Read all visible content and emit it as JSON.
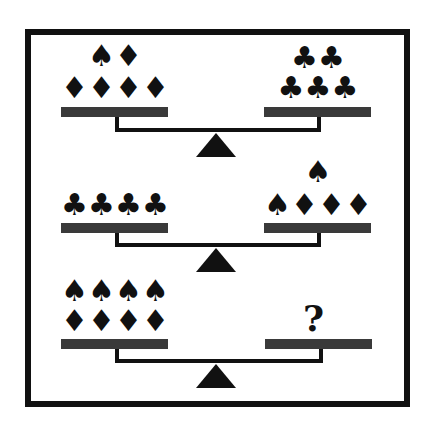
{
  "puzzle": {
    "type": "balance-scale-puzzle",
    "symbols": {
      "spade": "♠",
      "diamond": "♦",
      "club": "♣"
    },
    "scales": [
      {
        "left": {
          "rows": [
            [
              "♠",
              "♦"
            ],
            [
              "♦",
              "♦",
              "♦",
              "♦"
            ]
          ]
        },
        "right": {
          "rows": [
            [
              "♣",
              "♣"
            ],
            [
              "♣",
              "♣",
              "♣"
            ]
          ]
        }
      },
      {
        "left": {
          "rows": [
            [
              "♣",
              "♣",
              "♣",
              "♣"
            ]
          ]
        },
        "right": {
          "rows": [
            [
              "♠"
            ],
            [
              "♠",
              "♦",
              "♦",
              "♦"
            ]
          ]
        }
      },
      {
        "left": {
          "rows": [
            [
              "♠",
              "♠",
              "♠",
              "♠"
            ],
            [
              "♦",
              "♦",
              "♦",
              "♦"
            ]
          ]
        },
        "right": {
          "question": "?"
        }
      }
    ]
  }
}
